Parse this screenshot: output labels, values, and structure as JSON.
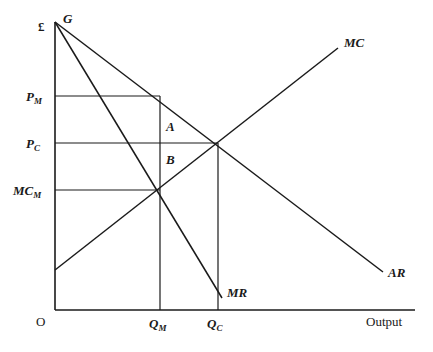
{
  "figure": {
    "width": 433,
    "height": 352,
    "background": "#ffffff",
    "line_color": "#1a1a1a",
    "text_color": "#1a1a1a"
  },
  "axes": {
    "y_axis_label": "£",
    "x_axis_label": "Output",
    "origin_label": "O",
    "y_axis_x": 55,
    "y_axis_top": 22,
    "x_axis_y": 310,
    "x_axis_right": 415
  },
  "curves": [
    {
      "id": "ar",
      "label": "AR",
      "type": "line",
      "from": [
        55,
        22
      ],
      "to": [
        383,
        272
      ],
      "label_pos": [
        388,
        266
      ]
    },
    {
      "id": "mr",
      "label": "MR",
      "type": "line",
      "from": [
        55,
        22
      ],
      "to": [
        222,
        298
      ],
      "label_pos": [
        227,
        286
      ]
    },
    {
      "id": "mc",
      "label": "MC",
      "type": "line",
      "from": [
        55,
        270
      ],
      "to": [
        338,
        48
      ],
      "label_pos": [
        344,
        36
      ]
    }
  ],
  "price_levels": [
    {
      "id": "pm",
      "label": "P",
      "sub": "M",
      "y": 96,
      "x_to": 160,
      "label_pos": [
        26,
        90
      ]
    },
    {
      "id": "pc",
      "label": "P",
      "sub": "C",
      "y": 143,
      "x_to": 218,
      "label_pos": [
        26,
        137
      ]
    },
    {
      "id": "mcm",
      "label": "MC",
      "sub": "M",
      "y": 190,
      "x_to": 160,
      "label_pos": [
        13,
        184
      ]
    }
  ],
  "quantities": [
    {
      "id": "qm",
      "label": "Q",
      "sub": "M",
      "x": 160,
      "y_from": 96,
      "y_to": 310,
      "label_pos": [
        149,
        317
      ]
    },
    {
      "id": "qc",
      "label": "Q",
      "sub": "C",
      "x": 218,
      "y_from": 143,
      "y_to": 310,
      "label_pos": [
        207,
        317
      ]
    }
  ],
  "point_labels": [
    {
      "id": "g",
      "label": "G",
      "pos": [
        63,
        12
      ]
    },
    {
      "id": "a",
      "label": "A",
      "pos": [
        166,
        120
      ]
    },
    {
      "id": "b",
      "label": "B",
      "pos": [
        166,
        153
      ]
    }
  ],
  "chart_data": {
    "type": "line",
    "title": "",
    "xlabel": "Output",
    "ylabel": "£",
    "grid": false,
    "legend": "inline-end-labels",
    "series": [
      {
        "name": "AR",
        "points": [
          [
            0,
            305
          ],
          [
            328,
            38
          ]
        ],
        "note": "Average revenue / demand curve from G on the price axis sloping down to the right."
      },
      {
        "name": "MR",
        "points": [
          [
            0,
            305
          ],
          [
            167,
            12
          ]
        ],
        "note": "Marginal revenue, twice the slope of AR, crossing the output axis to the left of Q_C."
      },
      {
        "name": "MC",
        "points": [
          [
            0,
            44
          ],
          [
            283,
            267
          ]
        ],
        "note": "Marginal cost curve sloping upward."
      }
    ],
    "annotations": [
      {
        "text": "G",
        "meaning": "Common vertical intercept of AR and MR"
      },
      {
        "text": "A",
        "meaning": "Upper deadweight-loss region between P_M and P_C at Q_M"
      },
      {
        "text": "B",
        "meaning": "Lower deadweight-loss region between P_C and MC_M at Q_M"
      },
      {
        "text": "P_M",
        "meaning": "Monopoly price"
      },
      {
        "text": "P_C",
        "meaning": "Competitive price"
      },
      {
        "text": "MC_M",
        "meaning": "Marginal cost at monopoly output"
      },
      {
        "text": "Q_M",
        "meaning": "Monopoly output where MR = MC"
      },
      {
        "text": "Q_C",
        "meaning": "Competitive output where AR = MC"
      }
    ],
    "xlim": [
      0,
      360
    ],
    "ylim": [
      0,
      290
    ]
  }
}
